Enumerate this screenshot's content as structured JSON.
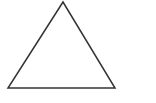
{
  "diagram": {
    "shape": "triangle",
    "background": "#ffffff",
    "stroke_color": "#333333",
    "stroke_width": 1.5,
    "fill": "none",
    "vertices": [
      [
        63,
        2
      ],
      [
        8,
        88
      ],
      [
        115,
        88
      ]
    ]
  }
}
